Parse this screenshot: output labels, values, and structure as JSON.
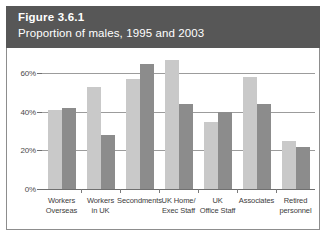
{
  "figure": {
    "number": "Figure 3.6.1",
    "subtitle": "Proportion of males, 1995 and 2003"
  },
  "chart_data": {
    "type": "bar",
    "title": "Proportion of males, 1995 and 2003",
    "xlabel": "",
    "ylabel": "",
    "ylim": [
      0,
      70
    ],
    "grid": true,
    "legend_position": "none",
    "yticks": [
      "0%",
      "20%",
      "40%",
      "60%"
    ],
    "ytick_values": [
      0,
      20,
      40,
      60
    ],
    "categories": [
      [
        "Workers",
        "Overseas"
      ],
      [
        "Workers",
        "in UK"
      ],
      [
        "Secondments"
      ],
      [
        "UK Home/",
        "Exec Staff"
      ],
      [
        "UK",
        "Office Staff"
      ],
      [
        "Associates"
      ],
      [
        "Retired",
        "personnel"
      ]
    ],
    "category_labels": [
      "Workers Overseas",
      "Workers in UK",
      "Secondments",
      "UK Home/Exec Staff",
      "UK Office Staff",
      "Associates",
      "Retired personnel"
    ],
    "series": [
      {
        "name": "1995",
        "color": "#c9c9c9",
        "values": [
          41,
          53,
          57,
          67,
          35,
          58,
          25
        ]
      },
      {
        "name": "2003",
        "color": "#8c8c8c",
        "values": [
          42,
          28,
          65,
          44,
          40,
          44,
          22
        ]
      }
    ]
  },
  "colors": {
    "title_band": "#575757",
    "series_1995": "#c9c9c9",
    "series_2003": "#8c8c8c",
    "gridline": "#9c9c9c",
    "border": "#8d8d8d"
  }
}
